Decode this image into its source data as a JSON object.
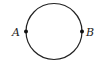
{
  "diagram": {
    "shape": "circle",
    "points": [
      {
        "label": "A",
        "position": "left"
      },
      {
        "label": "B",
        "position": "right"
      }
    ],
    "colors": {
      "stroke": "#222222",
      "background": "#ffffff"
    }
  }
}
